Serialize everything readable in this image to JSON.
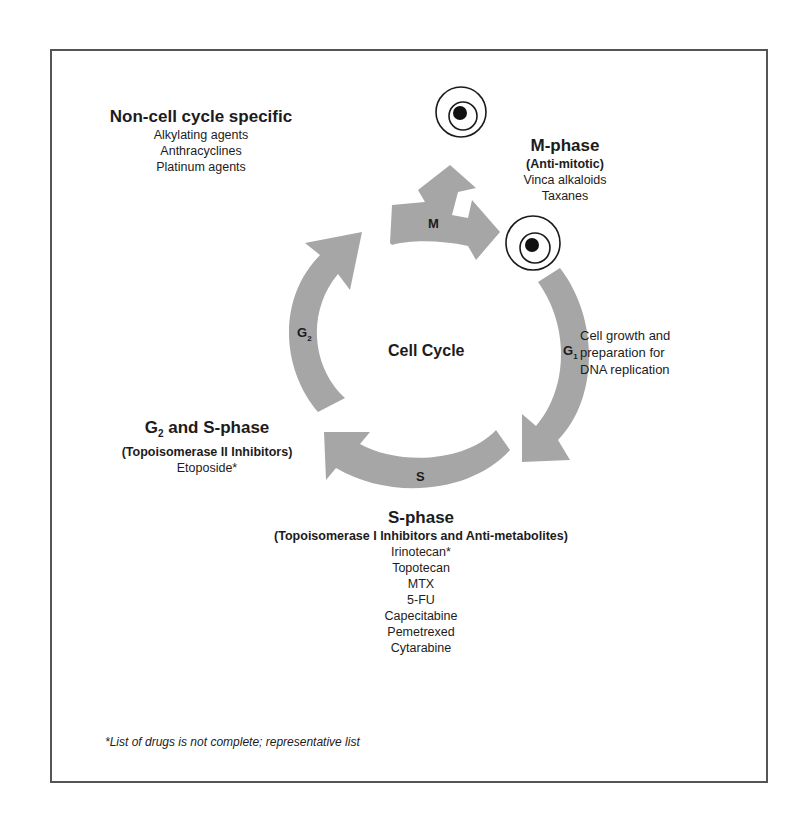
{
  "diagram": {
    "center_label": "Cell Cycle",
    "phases": [
      {
        "id": "M",
        "label": "M"
      },
      {
        "id": "G1",
        "label": "G",
        "sub": "1"
      },
      {
        "id": "S",
        "label": "S"
      },
      {
        "id": "G2",
        "label": "G",
        "sub": "2"
      }
    ],
    "arrow_color": "#a6a6a6",
    "groups": {
      "non_cell_cycle": {
        "title": "Non-cell cycle specific",
        "items": [
          "Alkylating agents",
          "Anthracyclines",
          "Platinum agents"
        ]
      },
      "m_phase": {
        "title": "M-phase",
        "subtitle": "(Anti-mitotic)",
        "items": [
          "Vinca alkaloids",
          "Taxanes"
        ]
      },
      "g1_description": {
        "lines": [
          "Cell growth and",
          "preparation for",
          "DNA replication"
        ]
      },
      "g2_s_phase": {
        "title_prefix": "G",
        "title_sub": "2",
        "title_suffix": " and S-phase",
        "subtitle": "(Topoisomerase II Inhibitors)",
        "items": [
          "Etoposide*"
        ]
      },
      "s_phase": {
        "title": "S-phase",
        "subtitle": "(Topoisomerase I Inhibitors and Anti-metabolites)",
        "items": [
          "Irinotecan*",
          "Topotecan",
          "MTX",
          "5-FU",
          "Capecitabine",
          "Pemetrexed",
          "Cytarabine"
        ]
      }
    },
    "footnote": "*List of drugs is not complete; representative list"
  }
}
